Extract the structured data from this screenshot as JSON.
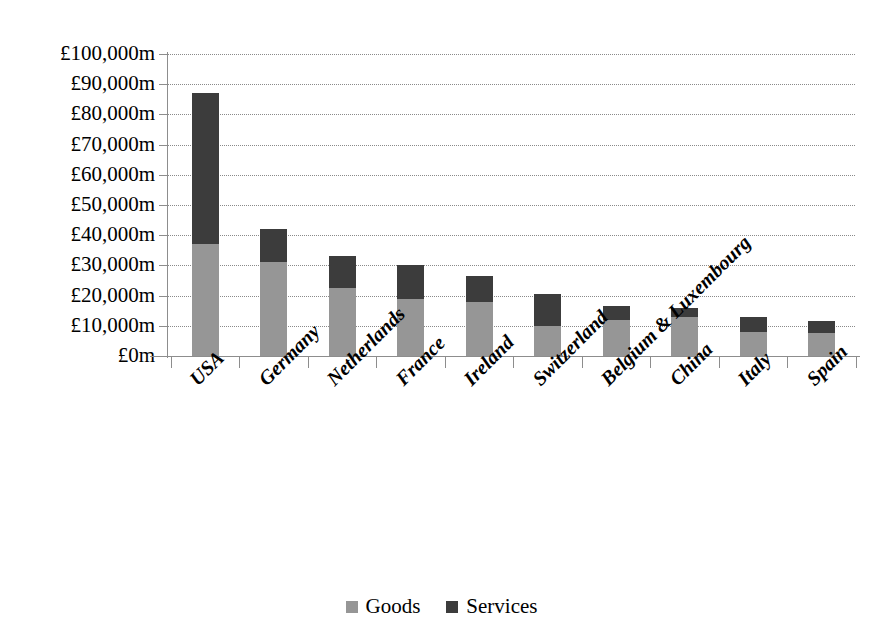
{
  "chart_data": {
    "type": "bar",
    "stacked": true,
    "title": "",
    "subtitle": "",
    "xlabel": "",
    "ylabel": "",
    "ylim": [
      0,
      100000
    ],
    "ytick_step": 10000,
    "ytick_labels": [
      "£100,000m",
      "£90,000m",
      "£80,000m",
      "£70,000m",
      "£60,000m",
      "£50,000m",
      "£40,000m",
      "£30,000m",
      "£20,000m",
      "£10,000m",
      "£0m"
    ],
    "ytick_values": [
      100000,
      90000,
      80000,
      70000,
      60000,
      50000,
      40000,
      30000,
      20000,
      10000,
      0
    ],
    "grid": true,
    "grid_style": "dotted-horizontal",
    "legend_position": "bottom",
    "categories": [
      "USA",
      "Germany",
      "Netherlands",
      "France",
      "Ireland",
      "Switzerland",
      "Belgium & Luxembourg",
      "China",
      "Italy",
      "Spain"
    ],
    "series": [
      {
        "name": "Goods",
        "color": "#969696",
        "values": [
          37000,
          31000,
          22500,
          19000,
          18000,
          10000,
          12000,
          13000,
          8000,
          7500
        ]
      },
      {
        "name": "Services",
        "color": "#3c3c3c",
        "values": [
          50000,
          11000,
          10500,
          11000,
          8500,
          10500,
          4500,
          3000,
          5000,
          4000
        ]
      }
    ],
    "totals": [
      87000,
      42000,
      33000,
      30000,
      26500,
      20500,
      16500,
      16000,
      13000,
      11500
    ]
  },
  "legend": {
    "items": [
      {
        "label": "Goods",
        "color": "#969696"
      },
      {
        "label": "Services",
        "color": "#3c3c3c"
      }
    ]
  },
  "axis": {
    "y_tick_labels": [
      "£100,000m",
      "£90,000m",
      "£80,000m",
      "£70,000m",
      "£60,000m",
      "£50,000m",
      "£40,000m",
      "£30,000m",
      "£20,000m",
      "£10,000m",
      "£0m"
    ],
    "x_tick_labels": [
      "USA",
      "Germany",
      "Netherlands",
      "France",
      "Ireland",
      "Switzerland",
      "Belgium & Luxembourg",
      "China",
      "Italy",
      "Spain"
    ]
  },
  "colors": {
    "goods": "#969696",
    "services": "#3c3c3c",
    "axis": "#8d8d8d",
    "grid": "#8a8a8a",
    "background": "#ffffff",
    "text": "#000000"
  }
}
